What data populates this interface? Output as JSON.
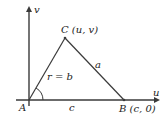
{
  "diagram": {
    "type": "triangle-in-coordinate-plane",
    "axes": {
      "horizontal_label": "u",
      "vertical_label": "v"
    },
    "vertices": {
      "A": {
        "label": "A"
      },
      "B": {
        "label": "B",
        "coords": "(c, 0)"
      },
      "C": {
        "label": "C",
        "coords": "(u, v)"
      }
    },
    "sides": {
      "AB": "c",
      "BC": "a",
      "AC": "r = b"
    },
    "angle_marker": "arc at vertex A",
    "colors": {
      "lines": "#3a3a3a",
      "text": "#222222",
      "background": "#ffffff"
    }
  }
}
